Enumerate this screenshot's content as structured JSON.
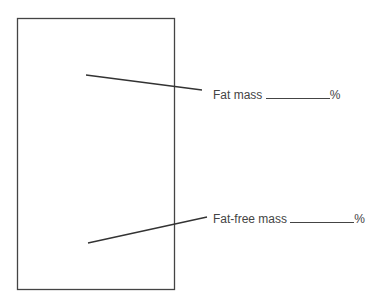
{
  "diagram": {
    "labels": [
      {
        "text": "Fat mass",
        "suffix": "%"
      },
      {
        "text": "Fat-free mass",
        "suffix": "%"
      }
    ]
  }
}
